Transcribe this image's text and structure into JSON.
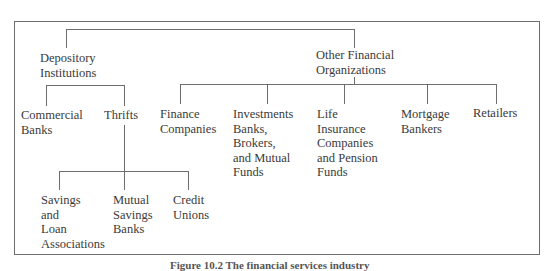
{
  "diagram": {
    "type": "tree",
    "root": {
      "children": [
        {
          "id": "depository",
          "lines": [
            "Depository",
            "Institutions"
          ],
          "children": [
            {
              "id": "commercial-banks",
              "lines": [
                "Commercial",
                "Banks"
              ]
            },
            {
              "id": "thrifts",
              "lines": [
                "Thrifts"
              ],
              "children": [
                {
                  "id": "savings-loan",
                  "lines": [
                    "Savings",
                    "and",
                    "Loan",
                    "Associations"
                  ]
                },
                {
                  "id": "mutual-savings",
                  "lines": [
                    "Mutual",
                    "Savings",
                    "Banks"
                  ]
                },
                {
                  "id": "credit-unions",
                  "lines": [
                    "Credit",
                    "Unions"
                  ]
                }
              ]
            }
          ]
        },
        {
          "id": "other-financial",
          "lines": [
            "Other Financial",
            "Organizations"
          ],
          "children": [
            {
              "id": "finance-companies",
              "lines": [
                "Finance",
                "Companies"
              ]
            },
            {
              "id": "investment-banks",
              "lines": [
                "Investments",
                "Banks,",
                "Brokers,",
                "and Mutual",
                "Funds"
              ]
            },
            {
              "id": "life-insurance",
              "lines": [
                "Life",
                "Insurance",
                "Companies",
                "and Pension",
                "Funds"
              ]
            },
            {
              "id": "mortgage-bankers",
              "lines": [
                "Mortgage",
                "Bankers"
              ]
            },
            {
              "id": "retailers",
              "lines": [
                "Retailers"
              ]
            }
          ]
        }
      ]
    },
    "caption": "Figure 10.2  The financial services industry"
  }
}
